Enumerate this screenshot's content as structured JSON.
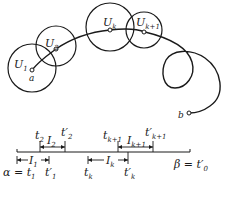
{
  "figure": {
    "type": "diagram",
    "colors": {
      "ink": "#1a1a1a",
      "background": "#ffffff"
    }
  },
  "curve": {
    "start_point_label": "a",
    "end_point_label": "b"
  },
  "discs": [
    {
      "label": "U",
      "sub": "1"
    },
    {
      "label": "U",
      "sub": "2"
    },
    {
      "label": "U",
      "sub": "k"
    },
    {
      "label": "U",
      "sub": "k+1"
    }
  ],
  "axis": {
    "left_label": "α = t",
    "left_sub": "1",
    "right_label": "β = t",
    "right_sub": "0",
    "right_prime": "′",
    "intervals": [
      {
        "name": "I",
        "sub": "1",
        "start": "t",
        "start_sub": "1",
        "end": "t′",
        "end_sub": "1",
        "position": "below"
      },
      {
        "name": "I",
        "sub": "2",
        "start": "t",
        "start_sub": "2",
        "end": "t′",
        "end_sub": "2",
        "position": "above"
      },
      {
        "name": "I",
        "sub": "k",
        "start": "t",
        "start_sub": "k",
        "end": "t′",
        "end_sub": "k",
        "position": "below"
      },
      {
        "name": "I",
        "sub": "k+1",
        "start": "t",
        "start_sub": "k+1",
        "end": "t′",
        "end_sub": "k+1",
        "position": "above"
      }
    ]
  }
}
